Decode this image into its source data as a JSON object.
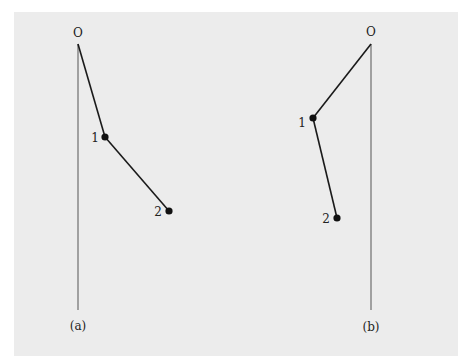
{
  "diagram": {
    "type": "double-pendulum",
    "panels": [
      {
        "id": "a",
        "caption": "(a)",
        "pivot_label": "O",
        "bob1_label": "1",
        "bob2_label": "2",
        "pivot": [
          78,
          44
        ],
        "vertical_end": [
          78,
          310
        ],
        "bob1": [
          105,
          137
        ],
        "bob2": [
          169,
          211
        ]
      },
      {
        "id": "b",
        "caption": "(b)",
        "pivot_label": "O",
        "bob1_label": "1",
        "bob2_label": "2",
        "pivot": [
          371,
          44
        ],
        "vertical_end": [
          371,
          310
        ],
        "bob1": [
          313,
          118
        ],
        "bob2": [
          337,
          218
        ]
      }
    ],
    "colors": {
      "background": "#ececec",
      "line": "#1a1a1a"
    }
  }
}
